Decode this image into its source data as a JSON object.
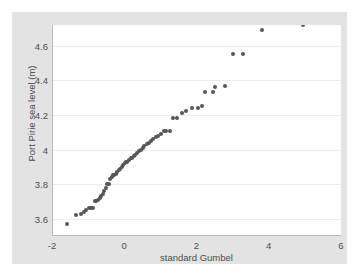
{
  "figure": {
    "background_color": "#e3e3e3",
    "plot_background_color": "#ffffff",
    "axis_color": "#b9b9b9",
    "grid_color": "#ededed",
    "marker_color": "#575757"
  },
  "chart_data": {
    "type": "scatter",
    "title": "",
    "subtitle": "",
    "xlabel": "standard Gumbel",
    "ylabel": "Port Pirie sea level (m)",
    "xlim": [
      -2,
      6
    ],
    "ylim": [
      3.5,
      4.72
    ],
    "xticks": [
      -2,
      0,
      2,
      4,
      6
    ],
    "xticklabels": [
      "-2",
      "0",
      "2",
      "4",
      "6"
    ],
    "yticks": [
      3.6,
      3.8,
      4,
      4.2,
      4.4,
      4.6
    ],
    "yticklabels": [
      "3.6",
      "3.8",
      "4",
      "4.2",
      "4.4",
      "4.6"
    ],
    "grid": "horizontal",
    "legend": null,
    "annotations": [],
    "marker_size_px": 4,
    "n_points": 65,
    "x": [
      -1.62,
      -1.35,
      -1.23,
      -1.15,
      -1.08,
      -1.01,
      -0.95,
      -0.9,
      -0.85,
      -0.8,
      -0.75,
      -0.7,
      -0.66,
      -0.62,
      -0.58,
      -0.54,
      -0.5,
      -0.46,
      -0.42,
      -0.38,
      -0.34,
      -0.3,
      -0.26,
      -0.22,
      -0.18,
      -0.14,
      -0.1,
      -0.06,
      -0.02,
      0.02,
      0.06,
      0.1,
      0.15,
      0.19,
      0.24,
      0.28,
      0.33,
      0.38,
      0.43,
      0.48,
      0.53,
      0.59,
      0.65,
      0.71,
      0.77,
      0.84,
      0.91,
      0.98,
      1.06,
      1.14,
      1.23,
      1.33,
      1.44,
      1.56,
      1.69,
      1.84,
      2.01,
      2.12,
      2.22,
      2.44,
      2.48,
      2.76,
      2.97,
      3.27,
      3.78,
      4.92
    ],
    "y": [
      3.57,
      3.62,
      3.63,
      3.64,
      3.65,
      3.66,
      3.66,
      3.66,
      3.7,
      3.7,
      3.71,
      3.72,
      3.73,
      3.74,
      3.76,
      3.78,
      3.8,
      3.8,
      3.83,
      3.84,
      3.85,
      3.85,
      3.86,
      3.87,
      3.88,
      3.89,
      3.9,
      3.91,
      3.92,
      3.93,
      3.93,
      3.94,
      3.95,
      3.95,
      3.96,
      3.97,
      3.98,
      3.99,
      4.0,
      4.01,
      4.02,
      4.03,
      4.04,
      4.05,
      4.06,
      4.07,
      4.08,
      4.09,
      4.11,
      4.11,
      4.11,
      4.18,
      4.18,
      4.21,
      4.22,
      4.24,
      4.24,
      4.25,
      4.33,
      4.33,
      4.36,
      4.37,
      4.55,
      4.55,
      4.69
    ]
  }
}
